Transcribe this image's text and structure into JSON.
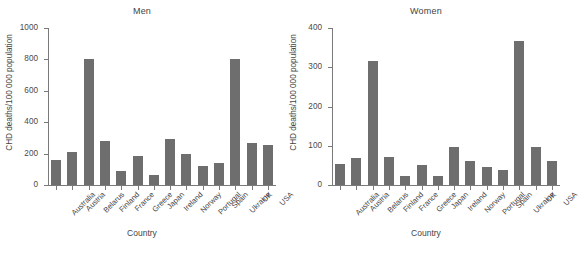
{
  "figure": {
    "background": "#ffffff",
    "bar_color": "#6e6e6e",
    "axis_color": "#7a7a7a"
  },
  "panels": [
    {
      "key": "men",
      "title": "Men",
      "xlabel": "Country",
      "ylabel": "CHD deaths/100 000 population",
      "yticks": [
        "0",
        "200",
        "400",
        "600",
        "800",
        "1000"
      ]
    },
    {
      "key": "women",
      "title": "Women",
      "xlabel": "Country",
      "ylabel": "CHD deaths/100 000 population",
      "yticks": [
        "0",
        "100",
        "200",
        "300",
        "400"
      ]
    }
  ],
  "chart_data": [
    {
      "type": "bar",
      "title": "Men",
      "xlabel": "Country",
      "ylabel": "CHD deaths/100 000 population",
      "ylim": [
        0,
        1000
      ],
      "ytick_values": [
        0,
        200,
        400,
        600,
        800,
        1000
      ],
      "grid": false,
      "legend": "none",
      "categories": [
        "Australia",
        "Austria",
        "Belarus",
        "Finland",
        "France",
        "Greece",
        "Japan",
        "Ireland",
        "Norway",
        "Portugal",
        "Spain",
        "Ukraine",
        "UK",
        "USA"
      ],
      "values": [
        160,
        210,
        805,
        280,
        90,
        185,
        65,
        290,
        200,
        120,
        140,
        805,
        270,
        255
      ]
    },
    {
      "type": "bar",
      "title": "Women",
      "xlabel": "Country",
      "ylabel": "CHD deaths/100 000 population",
      "ylim": [
        0,
        400
      ],
      "ytick_values": [
        0,
        100,
        200,
        300,
        400
      ],
      "grid": false,
      "legend": "none",
      "categories": [
        "Australia",
        "Austria",
        "Belarus",
        "Finland",
        "France",
        "Greece",
        "Japan",
        "Ireland",
        "Norway",
        "Portugal",
        "Spain",
        "Ukraine",
        "UK",
        "USA"
      ],
      "values": [
        53,
        70,
        317,
        72,
        22,
        52,
        23,
        97,
        62,
        45,
        37,
        367,
        98,
        62
      ]
    }
  ]
}
